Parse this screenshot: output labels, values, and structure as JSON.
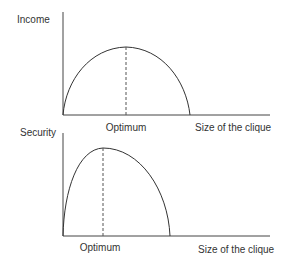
{
  "diagram": {
    "panels": [
      {
        "id": "income",
        "y_label": "Income",
        "optimum_label": "Optimum",
        "x_label": "Size of the clique",
        "shape": "inverted-U curve, symmetric, peak in middle",
        "peak_position": "center"
      },
      {
        "id": "security",
        "y_label": "Security",
        "optimum_label": "Optimum",
        "x_label": "Size of the clique",
        "shape": "inverted-U curve, skewed left, early peak",
        "peak_position": "left of center"
      }
    ],
    "colors": {
      "line": "#333333",
      "text": "#333333",
      "background": "#ffffff"
    }
  }
}
